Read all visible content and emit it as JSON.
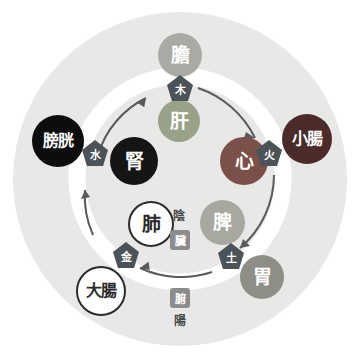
{
  "diagram": {
    "colors": {
      "backdrop": "#e8e8e6",
      "ring": "#ffffff",
      "arrow": "#5a5a5a",
      "pentagon": "#4c5358",
      "square_label": "#8c8c8c",
      "page_background": "#ffffff"
    },
    "phases": [
      {
        "id": "wood",
        "label": "木",
        "position": "top"
      },
      {
        "id": "fire",
        "label": "火",
        "position": "right"
      },
      {
        "id": "earth",
        "label": "土",
        "position": "bottom-right"
      },
      {
        "id": "metal",
        "label": "金",
        "position": "bottom-left"
      },
      {
        "id": "water",
        "label": "水",
        "position": "left"
      }
    ],
    "zang_organs": [
      {
        "id": "liver",
        "label": "肝",
        "phase": "木",
        "color": "#9aa189",
        "text_color": "#ffffff"
      },
      {
        "id": "heart",
        "label": "心",
        "phase": "火",
        "color": "#7c504a",
        "text_color": "#ffffff"
      },
      {
        "id": "spleen",
        "label": "脾",
        "phase": "土",
        "color": "#a8a8a0",
        "text_color": "#ffffff"
      },
      {
        "id": "lung",
        "label": "肺",
        "phase": "金",
        "color": "#ffffff",
        "text_color": "#2b2b2b"
      },
      {
        "id": "kidney",
        "label": "腎",
        "phase": "水",
        "color": "#151515",
        "text_color": "#ffffff"
      }
    ],
    "fu_organs": [
      {
        "id": "gallbladder",
        "label": "膽",
        "phase": "木",
        "color": "#a9aaa3",
        "text_color": "#ffffff"
      },
      {
        "id": "small-intestine",
        "label": "小腸",
        "phase": "火",
        "color": "#4b2b29",
        "text_color": "#ffffff"
      },
      {
        "id": "stomach",
        "label": "胃",
        "phase": "土",
        "color": "#8e8d86",
        "text_color": "#ffffff"
      },
      {
        "id": "large-intestine",
        "label": "大腸",
        "phase": "金",
        "color": "#ffffff",
        "text_color": "#2b2b2b"
      },
      {
        "id": "bladder",
        "label": "膀胱",
        "phase": "水",
        "color": "#0d0d0d",
        "text_color": "#ffffff"
      }
    ],
    "center_labels": {
      "yin": "陰",
      "zang": "臟",
      "fu": "腑",
      "yang": "陽"
    }
  }
}
